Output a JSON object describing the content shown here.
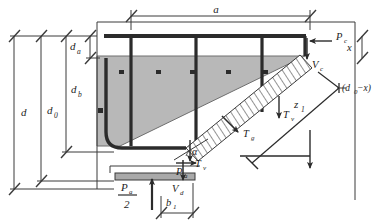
{
  "figure": {
    "kind": "strut-and-tie-diagram"
  },
  "colors": {
    "line": "#3a3a3a",
    "heavy_bar": "#2b2b2b",
    "shaded_fill": "#b8b8b8",
    "shaded_stroke": "#6e6e6e",
    "plate_fill": "#a9a9a9",
    "background": "#ffffff"
  },
  "dimensions": {
    "top_span": "a",
    "left_outer": "d",
    "left_second": "d",
    "left_second_sub": "0",
    "left_third": "d",
    "left_third_sub": "b",
    "top_small": "d",
    "top_small_sub": "a",
    "right_upper": "x",
    "right_lower": "(d",
    "right_lower_sub": "0",
    "right_lower_tail": "−x)",
    "bottom_plate": "b",
    "bottom_plate_sub": "1"
  },
  "forces": {
    "pc": {
      "label": "P",
      "sub": "c",
      "direction": "left-arrow"
    },
    "vc": {
      "label": "V",
      "sub": "c",
      "direction": "down-arrow"
    },
    "tv_upper": {
      "label": "T",
      "sub": "v",
      "direction": "down-arrow"
    },
    "tv_lower": {
      "label": "T",
      "sub": "v",
      "direction": "down-arrow"
    },
    "tg": {
      "label": "T",
      "sub": "g",
      "direction": "diagonal-arrow"
    },
    "pa_side": {
      "label": "P",
      "sub": "a",
      "direction": "right-arrow"
    },
    "vd": {
      "label": "V",
      "sub": "d",
      "direction": "down-arrow"
    },
    "pa_half_numerator": "P",
    "pa_half_numerator_sub": "a",
    "pa_half_denominator": "2",
    "pa_half_direction": "up-arrow"
  },
  "angles": {
    "alpha": "α"
  },
  "lever_arms": {
    "z1": "z",
    "z1_sub": "1"
  }
}
